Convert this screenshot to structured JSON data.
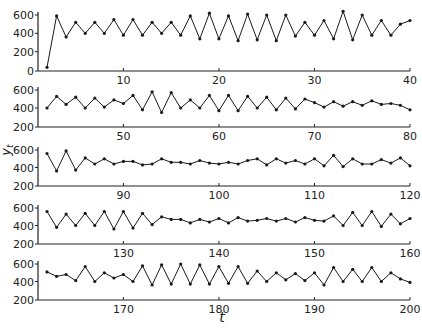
{
  "chart_data": {
    "type": "line",
    "title": "",
    "xlabel": "t",
    "ylabel": "y_t",
    "marker": "dot",
    "line_color": "#1a1a1a",
    "grid": false,
    "panels": [
      {
        "x_range": [
          1,
          40
        ],
        "ylim": [
          0,
          600
        ],
        "y_ticks": [
          0,
          200,
          400,
          600
        ],
        "x_ticks": [
          10,
          20,
          30,
          40
        ],
        "x": [
          2,
          3,
          4,
          5,
          6,
          7,
          8,
          9,
          10,
          11,
          12,
          13,
          14,
          15,
          16,
          17,
          18,
          19,
          20,
          21,
          22,
          23,
          24,
          25,
          26,
          27,
          28,
          29,
          30,
          31,
          32,
          33,
          34,
          35,
          36,
          37,
          38,
          39,
          40
        ],
        "values": [
          30,
          590,
          360,
          520,
          400,
          520,
          400,
          550,
          380,
          550,
          380,
          520,
          400,
          520,
          380,
          590,
          340,
          620,
          340,
          590,
          320,
          610,
          330,
          600,
          320,
          600,
          370,
          520,
          380,
          540,
          340,
          640,
          330,
          600,
          380,
          540,
          380,
          500,
          540
        ]
      },
      {
        "x_range": [
          41,
          80
        ],
        "ylim": [
          200,
          600
        ],
        "y_ticks": [
          200,
          400,
          600
        ],
        "x_ticks": [
          50,
          60,
          70,
          80
        ],
        "x": [
          42,
          43,
          44,
          45,
          46,
          47,
          48,
          49,
          50,
          51,
          52,
          53,
          54,
          55,
          56,
          57,
          58,
          59,
          60,
          61,
          62,
          63,
          64,
          65,
          66,
          67,
          68,
          69,
          70,
          71,
          72,
          73,
          74,
          75,
          76,
          77,
          78,
          79,
          80
        ],
        "values": [
          400,
          530,
          440,
          520,
          400,
          510,
          410,
          490,
          450,
          540,
          380,
          580,
          350,
          570,
          400,
          490,
          400,
          540,
          370,
          540,
          370,
          530,
          400,
          520,
          380,
          510,
          390,
          500,
          460,
          410,
          470,
          420,
          470,
          430,
          480,
          440,
          450,
          430,
          380
        ]
      },
      {
        "x_range": [
          81,
          120
        ],
        "ylim": [
          200,
          600
        ],
        "y_ticks": [
          200,
          400,
          600
        ],
        "x_ticks": [
          90,
          100,
          110,
          120
        ],
        "x": [
          82,
          83,
          84,
          85,
          86,
          87,
          88,
          89,
          90,
          91,
          92,
          93,
          94,
          95,
          96,
          97,
          98,
          99,
          100,
          101,
          102,
          103,
          104,
          105,
          106,
          107,
          108,
          109,
          110,
          111,
          112,
          113,
          114,
          115,
          116,
          117,
          118,
          119,
          120
        ],
        "values": [
          560,
          360,
          590,
          370,
          510,
          440,
          500,
          440,
          470,
          470,
          430,
          440,
          500,
          460,
          460,
          440,
          480,
          450,
          440,
          460,
          440,
          480,
          500,
          430,
          500,
          450,
          480,
          440,
          500,
          420,
          540,
          410,
          500,
          440,
          440,
          490,
          450,
          510,
          420
        ]
      },
      {
        "x_range": [
          121,
          160
        ],
        "ylim": [
          200,
          600
        ],
        "y_ticks": [
          200,
          400,
          600
        ],
        "x_ticks": [
          130,
          140,
          150,
          160
        ],
        "x": [
          122,
          123,
          124,
          125,
          126,
          127,
          128,
          129,
          130,
          131,
          132,
          133,
          134,
          135,
          136,
          137,
          138,
          139,
          140,
          141,
          142,
          143,
          144,
          145,
          146,
          147,
          148,
          149,
          150,
          151,
          152,
          153,
          154,
          155,
          156,
          157,
          158,
          159,
          160
        ],
        "values": [
          560,
          380,
          530,
          400,
          540,
          400,
          560,
          360,
          560,
          370,
          540,
          410,
          500,
          470,
          470,
          430,
          470,
          440,
          480,
          430,
          490,
          450,
          460,
          480,
          450,
          480,
          440,
          490,
          460,
          450,
          510,
          400,
          550,
          400,
          560,
          390,
          530,
          420,
          480
        ]
      },
      {
        "x_range": [
          161,
          200
        ],
        "ylim": [
          200,
          600
        ],
        "y_ticks": [
          200,
          400,
          600
        ],
        "x_ticks": [
          170,
          180,
          190,
          200
        ],
        "x": [
          162,
          163,
          164,
          165,
          166,
          167,
          168,
          169,
          170,
          171,
          172,
          173,
          174,
          175,
          176,
          177,
          178,
          179,
          180,
          181,
          182,
          183,
          184,
          185,
          186,
          187,
          188,
          189,
          190,
          191,
          192,
          193,
          194,
          195,
          196,
          197,
          198,
          199,
          200
        ],
        "values": [
          510,
          460,
          480,
          410,
          570,
          400,
          500,
          440,
          480,
          400,
          580,
          360,
          590,
          370,
          600,
          370,
          590,
          370,
          570,
          380,
          570,
          380,
          520,
          400,
          500,
          420,
          490,
          410,
          500,
          360,
          560,
          400,
          540,
          400,
          560,
          400,
          500,
          430,
          390
        ]
      }
    ]
  },
  "axes": {
    "xlabel": "t",
    "ylabel": "y_t"
  }
}
